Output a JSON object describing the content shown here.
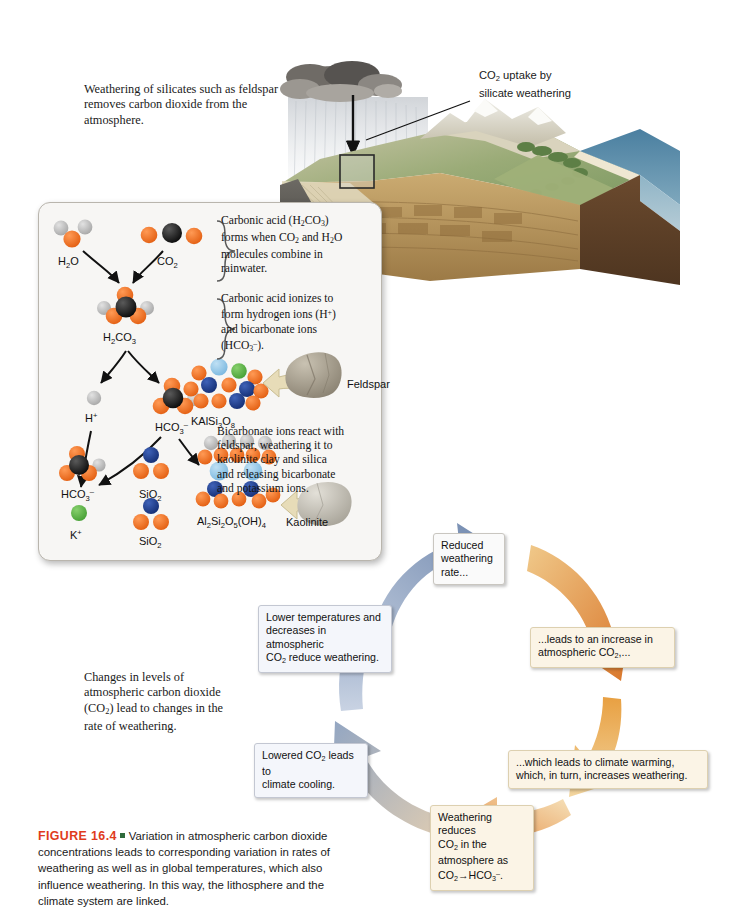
{
  "figure": {
    "number": "FIGURE 16.4",
    "caption": "Variation in atmospheric carbon dioxide concentrations leads to corresponding variation in rates of weathering as well as in global temperatures, which also influence weathering. In this way, the lithosphere and the climate system are linked.",
    "number_color": "#e03b1c",
    "bullet_color": "#2f6b3c"
  },
  "annotations": {
    "top_left": "Weathering of silicates such as feldspar removes carbon dioxide from the atmosphere.",
    "block_label": "CO₂ uptake by silicate weathering",
    "block_label_line1": "CO2 uptake by",
    "block_label_line2": "silicate weathering",
    "mid_left": "Changes in levels of atmospheric carbon dioxide (CO₂) lead to changes in the rate of weathering."
  },
  "inset": {
    "steps": [
      {
        "id": "carbonic-acid-formation",
        "text": "Carbonic acid (H2CO3) forms when CO2 and H2O molecules combine in rainwater.",
        "line1": "Carbonic acid (H2CO3)",
        "line2": "forms when CO2 and H2O",
        "line3": "molecules combine in",
        "line4": "rainwater."
      },
      {
        "id": "ionization",
        "text": "Carbonic acid ionizes to form hydrogen ions (H+) and bicarbonate ions (HCO3-).",
        "line1": "Carbonic acid ionizes to",
        "line2": "form hydrogen ions (H+)",
        "line3": "and bicarbonate ions",
        "line4": "(HCO3-)."
      },
      {
        "id": "feldspar-weathering",
        "text": "Bicarbonate ions react with feldspar, weathering it to kaolinite clay and silica and releasing bicarbonate and potassium ions.",
        "line1": "Bicarbonate ions react with",
        "line2": "feldspar, weathering it to",
        "line3": "kaolinite clay and silica",
        "line4": "and releasing bicarbonate",
        "line5": "and potassium ions."
      }
    ],
    "molecules": {
      "water": "H2O",
      "carbon_dioxide": "CO2",
      "carbonic_acid": "H2CO3",
      "hydrogen_ion": "H+",
      "bicarbonate_top": "HCO3-",
      "feldspar_formula": "KAlSi3O8",
      "bicarbonate_product": "HCO3-",
      "silica_1": "SiO2",
      "silica_2": "SiO2",
      "potassium_ion": "K+",
      "kaolinite_formula": "Al2Si2O5(OH)4"
    },
    "rocks": {
      "feldspar": "Feldspar",
      "kaolinite": "Kaolinite"
    },
    "atom_colors": {
      "oxygen": "#ef6a1e",
      "carbon": "#111111",
      "hydrogen": "#b9b9b9",
      "silicon": "#1f3f8f",
      "aluminum": "#8fc6e8",
      "potassium": "#5fb04a"
    }
  },
  "cycle": {
    "boxes": [
      {
        "id": "reduced-weathering",
        "style": "plain",
        "line1": "Reduced",
        "line2": "weathering",
        "line3": "rate..."
      },
      {
        "id": "increase-co2",
        "style": "warm",
        "line1": "...leads to an increase in",
        "line2": "atmospheric CO2,..."
      },
      {
        "id": "climate-warming",
        "style": "warm",
        "line1": "...which leads to climate warming,",
        "line2": "which, in turn, increases weathering."
      },
      {
        "id": "weathering-reduces-co2",
        "style": "warm",
        "line1": "Weathering reduces",
        "line2": "CO2 in the",
        "line3": "atmosphere as",
        "line4": "CO2—▶HCO3-."
      },
      {
        "id": "lowered-co2-cooling",
        "style": "cool",
        "line1": "Lowered CO2 leads to",
        "line2": "climate cooling."
      },
      {
        "id": "lower-temperatures",
        "style": "cool",
        "line1": "Lower temperatures and",
        "line2": "decreases in atmospheric",
        "line3": "CO2 reduce weathering."
      }
    ],
    "arrow_colors": {
      "cool": "#8fa6c8",
      "warm_orange": "#e8a13c",
      "warm_deep": "#d4722a",
      "pale": "#f0d7a8",
      "blue_grey": "#9aa9c0"
    }
  }
}
